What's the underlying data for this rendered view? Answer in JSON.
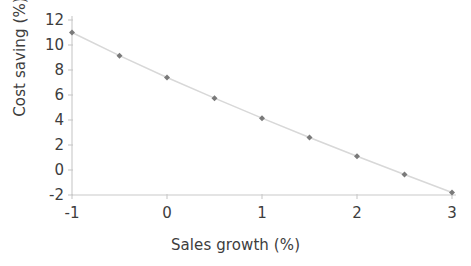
{
  "chart_data": {
    "type": "line",
    "title": "",
    "subtitle": "",
    "xlabel": "Sales growth (%)",
    "ylabel": "Cost saving (%)",
    "x": [
      -1,
      -0.5,
      0,
      0.5,
      1,
      1.5,
      2,
      2.5,
      3
    ],
    "values": [
      11.0,
      9.15,
      7.4,
      5.75,
      4.15,
      2.6,
      1.1,
      -0.35,
      -1.8
    ],
    "series": [
      {
        "name": "Cost saving",
        "values": [
          11.0,
          9.15,
          7.4,
          5.75,
          4.15,
          2.6,
          1.1,
          -0.35,
          -1.8
        ]
      }
    ],
    "xlim": [
      -1,
      3
    ],
    "ylim": [
      -2,
      12
    ],
    "xticks": [
      -1,
      0,
      1,
      2,
      3
    ],
    "xtick_labels": [
      "-1",
      "0",
      "1",
      "2",
      "3"
    ],
    "yticks": [
      -2,
      0,
      2,
      4,
      6,
      8,
      10,
      12
    ],
    "ytick_labels": [
      "-2",
      "0",
      "2",
      "4",
      "6",
      "8",
      "10",
      "12"
    ],
    "grid": false,
    "legend": false,
    "legend_position": "none",
    "marker": "diamond",
    "marker_color": "#7a7a7a",
    "line_color": "#d8d8d8",
    "axis_color": "#c9c9c9",
    "text_color": "#3d3d3d",
    "background": "#ffffff"
  }
}
